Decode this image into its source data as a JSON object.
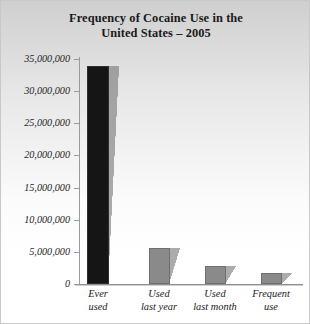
{
  "chart_data": {
    "type": "bar",
    "title": "Frequency of Cocaine Use in the United States – 2005",
    "title_lines": [
      "Frequency of Cocaine Use in the",
      "United States – 2005"
    ],
    "xlabel": "",
    "ylabel": "",
    "ylim": [
      0,
      35000000
    ],
    "ytick_step": 5000000,
    "grid": false,
    "legend": "none",
    "categories": [
      "Ever used",
      "Used last year",
      "Used last month",
      "Frequent use"
    ],
    "category_lines": [
      [
        "Ever",
        "used"
      ],
      [
        "Used",
        "last year"
      ],
      [
        "Used",
        "last month"
      ],
      [
        "Frequent",
        "use"
      ]
    ],
    "values": [
      33900000,
      5600000,
      2800000,
      1700000
    ],
    "ytick_labels": [
      "35,000,000",
      "30,000,000",
      "25,000,000",
      "20,000,000",
      "15,000,000",
      "10,000,000",
      "5,000,000",
      "0"
    ],
    "ytick_values": [
      35000000,
      30000000,
      25000000,
      20000000,
      15000000,
      10000000,
      5000000,
      0
    ],
    "bar_colors": [
      "#151515",
      "#8a8a8a",
      "#8a8a8a",
      "#8a8a8a"
    ],
    "axis_color": "#8f8f8f",
    "text_color": "#1b1b1b",
    "background": "#e9e9e9"
  }
}
